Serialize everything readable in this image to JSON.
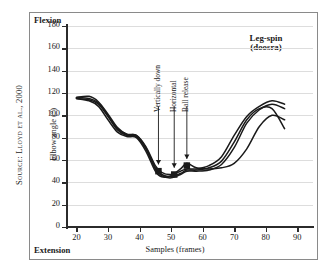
{
  "source_credit": "Source: Lloyd et al., 2000",
  "corner_labels": {
    "top": "Flexion",
    "bottom": "Extension"
  },
  "chart_data": {
    "type": "line",
    "title": "Leg-spin\n(doosra)",
    "title_lines": [
      "Leg-spin",
      "(doosra)"
    ],
    "xlabel": "Samples (frames)",
    "ylabel": "Elbow angle (°)",
    "xlim": [
      17,
      95
    ],
    "ylim": [
      0,
      180
    ],
    "xticks": [
      20,
      30,
      40,
      50,
      60,
      70,
      80,
      90
    ],
    "yticks": [
      0,
      20,
      40,
      60,
      80,
      100,
      120,
      140,
      160,
      180
    ],
    "grid": "horizontal",
    "legend": "none",
    "series": [
      {
        "name": "trial-1",
        "x": [
          20,
          24,
          27,
          30,
          33,
          36,
          39,
          42,
          45,
          47,
          50,
          53,
          55,
          58,
          62,
          66,
          70,
          74,
          78,
          82,
          86
        ],
        "y": [
          116,
          117,
          112,
          101,
          89,
          83,
          82,
          72,
          55,
          49,
          47,
          50,
          52,
          52,
          55,
          63,
          82,
          99,
          108,
          113,
          110
        ]
      },
      {
        "name": "trial-2",
        "x": [
          20,
          24,
          27,
          30,
          33,
          36,
          39,
          42,
          45,
          47,
          50,
          53,
          55,
          58,
          62,
          66,
          70,
          74,
          78,
          82,
          86
        ],
        "y": [
          115,
          114,
          110,
          99,
          87,
          82,
          81,
          70,
          52,
          46,
          44,
          47,
          50,
          50,
          51,
          56,
          71,
          93,
          105,
          110,
          106
        ]
      },
      {
        "name": "trial-3",
        "x": [
          20,
          24,
          27,
          30,
          33,
          36,
          39,
          42,
          45,
          47,
          50,
          53,
          55,
          58,
          62,
          66,
          70,
          74,
          78,
          82,
          86
        ],
        "y": [
          115,
          113,
          108,
          96,
          85,
          81,
          80,
          68,
          50,
          45,
          46,
          52,
          57,
          53,
          52,
          53,
          57,
          70,
          90,
          100,
          96
        ]
      },
      {
        "name": "trial-4",
        "x": [
          20,
          24,
          27,
          30,
          33,
          36,
          39,
          42,
          45,
          47,
          50,
          53,
          55,
          58,
          62,
          66,
          70,
          74,
          78,
          82,
          86
        ],
        "y": [
          116,
          115,
          111,
          100,
          88,
          83,
          82,
          71,
          53,
          47,
          45,
          48,
          51,
          51,
          53,
          59,
          76,
          96,
          106,
          106,
          88
        ]
      }
    ],
    "markers": [
      {
        "label": "Vertically down",
        "x": 46,
        "y": 50
      },
      {
        "label": "Horizontal",
        "x": 51,
        "y": 47
      },
      {
        "label": "Ball release",
        "x": 55,
        "y": 55
      }
    ],
    "annotations": [
      {
        "label": "Vertically down",
        "arrow_x": 46,
        "arrow_top": 108,
        "arrow_bottom": 56
      },
      {
        "label": "Horizontal",
        "arrow_x": 51,
        "arrow_top": 108,
        "arrow_bottom": 53
      },
      {
        "label": "Ball release",
        "arrow_x": 55,
        "arrow_top": 108,
        "arrow_bottom": 61
      }
    ]
  },
  "colors": {
    "curve": "#1a1a1a",
    "axis": "#2b2b2b",
    "grid": "#dddddd",
    "frame": "#8a8a8a",
    "background": "#ffffff"
  }
}
